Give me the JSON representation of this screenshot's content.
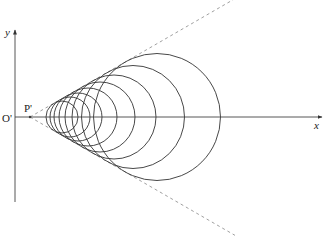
{
  "diagram": {
    "title": "",
    "labels": {
      "y_axis": "y",
      "x_axis": "x",
      "origin": "O'",
      "vertex": "P'"
    },
    "axes": {
      "origin_px": [
        15,
        117
      ],
      "x_axis_end_px": [
        322,
        117
      ],
      "y_axis_top_px": 30,
      "y_axis_bottom_px": 202
    },
    "vertex_px": [
      30,
      117
    ],
    "cone_half_angle_deg": 30,
    "cone_line_style": "dashed",
    "circle_style": "solid",
    "circles": [
      {
        "cx": 62,
        "r": 16
      },
      {
        "cx": 70,
        "r": 20
      },
      {
        "cx": 78,
        "r": 24
      },
      {
        "cx": 88,
        "r": 29
      },
      {
        "cx": 100,
        "r": 35
      },
      {
        "cx": 114,
        "r": 42
      },
      {
        "cx": 133,
        "r": 51.5
      },
      {
        "cx": 157,
        "r": 63.5
      }
    ],
    "colors": {
      "stroke": "#333333",
      "dashed": "#888888",
      "axis": "#444444"
    }
  }
}
